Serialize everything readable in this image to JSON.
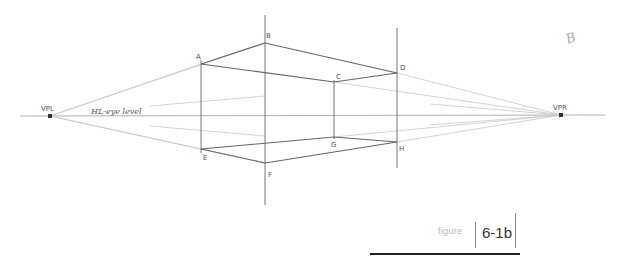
{
  "diagram": {
    "horizon_label": "HL-eye level",
    "vanishing_points": {
      "left": {
        "label": "VPL",
        "x": 50,
        "y": 116
      },
      "right": {
        "label": "VPR",
        "x": 561,
        "y": 115
      }
    },
    "points": [
      {
        "label": "A",
        "x": 201,
        "y": 64
      },
      {
        "label": "B",
        "x": 265,
        "y": 43
      },
      {
        "label": "C",
        "x": 334,
        "y": 82
      },
      {
        "label": "D",
        "x": 397,
        "y": 73
      },
      {
        "label": "E",
        "x": 201,
        "y": 149
      },
      {
        "label": "F",
        "x": 265,
        "y": 163
      },
      {
        "label": "G",
        "x": 334,
        "y": 137
      },
      {
        "label": "H",
        "x": 397,
        "y": 142
      }
    ],
    "corner_mark": "B"
  },
  "caption": {
    "word": "figure",
    "number": "6-1b"
  }
}
